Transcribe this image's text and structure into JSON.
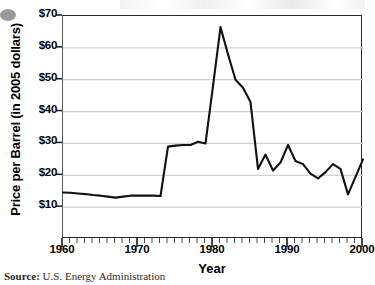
{
  "chart_data": {
    "type": "line",
    "title": "",
    "xlabel": "Year",
    "ylabel": "Price per Barrel (in 2005 dollars)",
    "xlim": [
      1960,
      2000
    ],
    "ylim": [
      0,
      70
    ],
    "grid": "horizontal",
    "legend": "none",
    "y_tick_labels": [
      "$70",
      "$60",
      "$50",
      "$40",
      "$30",
      "$20",
      "$10"
    ],
    "y_tick_values": [
      70,
      60,
      50,
      40,
      30,
      20,
      10
    ],
    "x_tick_labels": [
      "1960",
      "1970",
      "1980",
      "1990",
      "2000"
    ],
    "x_tick_values": [
      1960,
      1970,
      1980,
      1990,
      2000
    ],
    "x_minor_tick_step": 1,
    "series": [
      {
        "name": "Crude oil price per barrel",
        "color": "#111111",
        "x": [
          1960,
          1961,
          1962,
          1963,
          1964,
          1965,
          1966,
          1967,
          1968,
          1969,
          1970,
          1971,
          1972,
          1973,
          1974,
          1975,
          1976,
          1977,
          1978,
          1979,
          1980,
          1981,
          1982,
          1983,
          1984,
          1985,
          1986,
          1987,
          1988,
          1989,
          1990,
          1991,
          1992,
          1993,
          1994,
          1995,
          1996,
          1997,
          1998,
          1999,
          2000
        ],
        "values": [
          14.6,
          14.5,
          14.3,
          14.1,
          13.8,
          13.6,
          13.3,
          13.0,
          13.3,
          13.6,
          13.6,
          13.6,
          13.6,
          13.5,
          29.0,
          29.3,
          29.5,
          29.5,
          30.5,
          30.0,
          48.0,
          66.5,
          58.0,
          50.0,
          47.5,
          43.0,
          22.0,
          26.5,
          21.5,
          24.0,
          29.5,
          24.5,
          23.5,
          20.5,
          19.0,
          21.0,
          23.5,
          22.0,
          14.0,
          19.5,
          25.0
        ]
      }
    ]
  },
  "source": {
    "prefix": "Source:",
    "text": "U.S. Energy Administration"
  }
}
